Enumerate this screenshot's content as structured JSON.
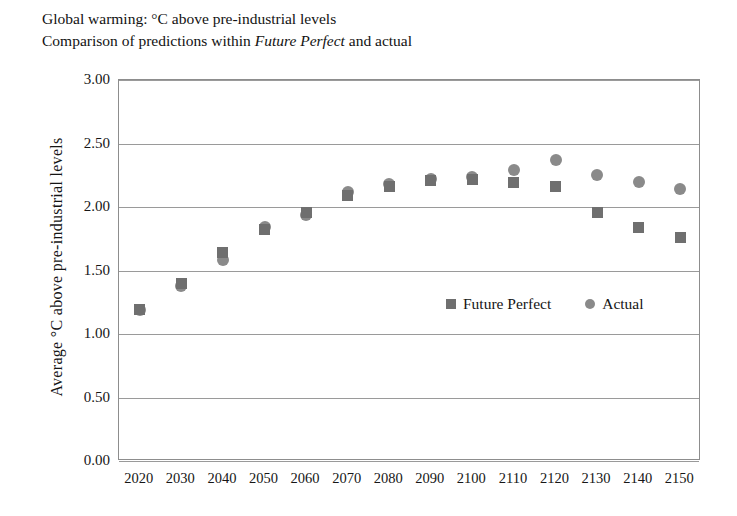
{
  "title": {
    "line1": "Global warming: °C above pre-industrial levels",
    "line2_prefix": "Comparison of predictions within ",
    "line2_emphasis": "Future Perfect",
    "line2_suffix": " and actual"
  },
  "chart_data": {
    "type": "scatter",
    "title": "Global warming: °C above pre-industrial levels",
    "subtitle": "Comparison of predictions within Future Perfect and actual",
    "xlabel": "",
    "ylabel": "Average °C above pre-industrial levels",
    "categories": [
      "2020",
      "2030",
      "2040",
      "2050",
      "2060",
      "2070",
      "2080",
      "2090",
      "2100",
      "2110",
      "2120",
      "2130",
      "2140",
      "2150"
    ],
    "series": [
      {
        "name": "Future Perfect",
        "marker": "square",
        "color": "#6f6f6f",
        "values": [
          1.19,
          1.4,
          1.64,
          1.82,
          1.96,
          2.09,
          2.16,
          2.21,
          2.22,
          2.19,
          2.16,
          1.96,
          1.84,
          1.76
        ]
      },
      {
        "name": "Actual",
        "marker": "circle",
        "color": "#8a8a8a",
        "values": [
          1.19,
          1.38,
          1.58,
          1.84,
          1.94,
          2.12,
          2.18,
          2.22,
          2.24,
          2.29,
          2.37,
          2.25,
          2.2,
          2.14
        ]
      }
    ],
    "ylim": [
      0.0,
      3.0
    ],
    "yticks": [
      0.0,
      0.5,
      1.0,
      1.5,
      2.0,
      2.5,
      3.0
    ],
    "ytick_labels": [
      "0.00",
      "0.50",
      "1.00",
      "1.50",
      "2.00",
      "2.50",
      "3.00"
    ],
    "grid": true,
    "legend_position": "inside-center-right",
    "legend": [
      "Future Perfect",
      "Actual"
    ]
  },
  "legend": {
    "entries": [
      {
        "label": "Future Perfect",
        "marker": "square-marker-icon"
      },
      {
        "label": "Actual",
        "marker": "circle-marker-icon"
      }
    ]
  },
  "colors": {
    "future_perfect": "#6f6f6f",
    "actual": "#8a8a8a",
    "gridline": "#9a9a9a",
    "frame": "#8d8d8d",
    "text": "#161616",
    "background": "#ffffff"
  }
}
